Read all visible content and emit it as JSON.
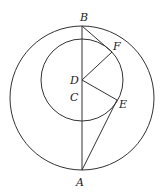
{
  "figure": {
    "points": {
      "A": {
        "label": "A",
        "x": 82,
        "y": 170
      },
      "B": {
        "label": "B",
        "x": 82,
        "y": 26
      },
      "C": {
        "label": "C",
        "x": 82,
        "y": 98
      },
      "D": {
        "label": "D",
        "x": 82,
        "y": 80
      },
      "E": {
        "label": "E",
        "x": 117,
        "y": 100
      },
      "F": {
        "label": "F",
        "x": 112,
        "y": 52
      }
    },
    "circles": [
      {
        "name": "outer",
        "center": "C",
        "r": 72
      },
      {
        "name": "inner",
        "center": "D",
        "r": 41
      }
    ],
    "segments": [
      "AB",
      "BF",
      "DF",
      "DE",
      "AE"
    ],
    "stroke_color": "#333333"
  }
}
